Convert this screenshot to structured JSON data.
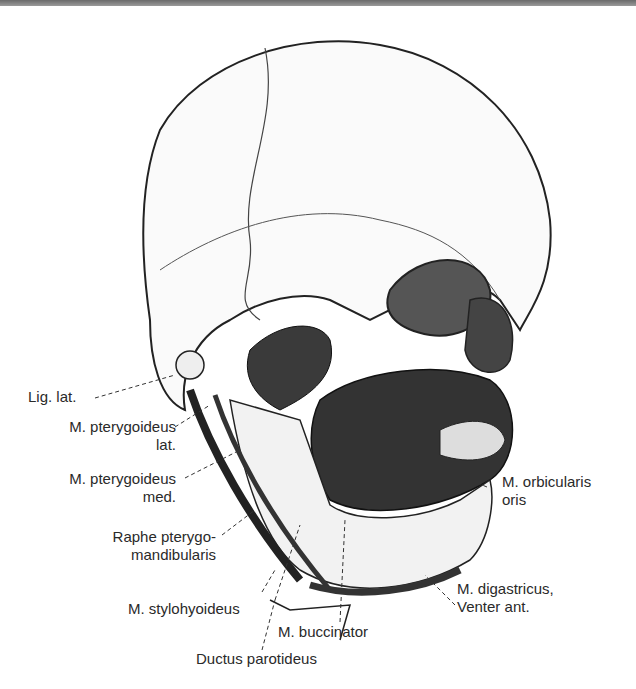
{
  "figure": {
    "labels": {
      "lig_lat": "Lig. lat.",
      "pter_lat_1": "M. pterygoideus",
      "pter_lat_2": "lat.",
      "pter_med_1": "M. pterygoideus",
      "pter_med_2": "med.",
      "raphe_1": "Raphe pterygo-",
      "raphe_2": "mandibularis",
      "stylohyoideus": "M. stylohyoideus",
      "buccinator": "M. buccinator",
      "ductus": "Ductus parotideus",
      "orbicularis_1": "M. orbicularis",
      "orbicularis_2": "oris",
      "digastricus_1": "M. digastricus,",
      "digastricus_2": "Venter ant."
    }
  }
}
